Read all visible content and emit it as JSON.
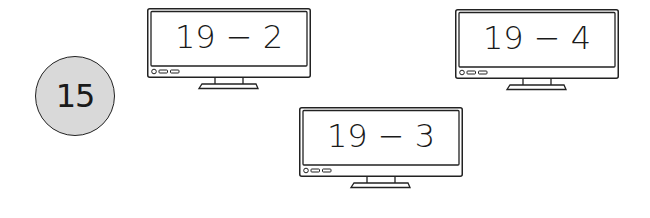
{
  "question_number": "15",
  "screens": [
    {
      "expression": "19 − 2"
    },
    {
      "expression": "19 − 4"
    },
    {
      "expression": "19 − 3"
    }
  ],
  "colors": {
    "badge_fill": "#d9d9d9",
    "outline": "#222222"
  }
}
